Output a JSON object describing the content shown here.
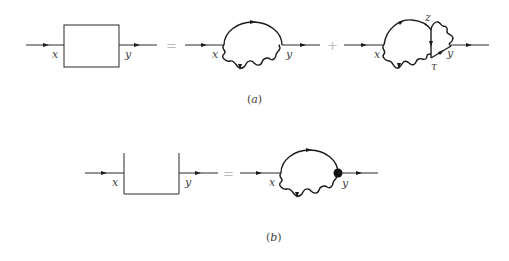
{
  "diagram": {
    "type": "feynman-diagram-equations",
    "panel_a": {
      "caption": "(a)",
      "lhs": {
        "shape": "closed-box",
        "labels": {
          "in": "x",
          "out": "y"
        }
      },
      "operator_1": "=",
      "term_1": {
        "shape": "self-energy-loop",
        "labels": {
          "in": "x",
          "out": "y"
        }
      },
      "operator_2": "+",
      "term_2": {
        "shape": "vertex-correction-loop",
        "labels": {
          "in": "x",
          "out": "y",
          "top_vertex": "z",
          "bottom_vertex": "τ"
        }
      }
    },
    "panel_b": {
      "caption": "(b)",
      "lhs": {
        "shape": "open-box",
        "labels": {
          "in": "x",
          "out": "y"
        }
      },
      "operator_1": "=",
      "term_1": {
        "shape": "self-energy-loop-dressed-vertex",
        "labels": {
          "in": "x",
          "out": "y"
        },
        "vertex_marker": "filled-dot"
      }
    }
  },
  "labels": {
    "a_box_x": "x",
    "a_box_y": "y",
    "a_t1_x": "x",
    "a_t1_y": "y",
    "a_t2_x": "x",
    "a_t2_y": "y",
    "a_t2_z": "z",
    "a_t2_tau": "τ",
    "b_box_x": "x",
    "b_box_y": "y",
    "b_t1_x": "x",
    "b_t1_y": "y",
    "eq_a": "=",
    "plus_a": "+",
    "eq_b": "=",
    "caption_a": "(a)",
    "caption_b": "(b)"
  }
}
